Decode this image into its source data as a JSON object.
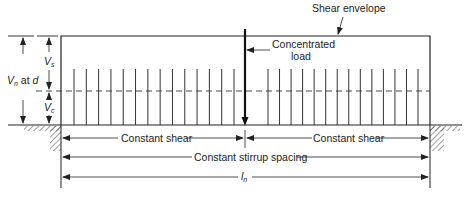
{
  "diagram": {
    "type": "shear envelope with stirrups",
    "labels": {
      "shear_envelope": "Shear envelope",
      "concentrated_load_line1": "Concentrated",
      "concentrated_load_line2": "load",
      "vs": "V",
      "vs_sub": "s",
      "vc": "V",
      "vc_sub": "c",
      "vn": "V",
      "vn_sub": "n",
      "vn_suffix": " at ",
      "vn_d": "d",
      "constant_shear_left": "Constant shear",
      "constant_shear_right": "Constant shear",
      "constant_stirrup_spacing": "Constant stirrup spacing",
      "ln": "l",
      "ln_sub": "n"
    },
    "stirrups_left_count": 14,
    "stirrups_right_count": 14,
    "colors": {
      "line": "#222222",
      "hatch": "#444444"
    }
  }
}
